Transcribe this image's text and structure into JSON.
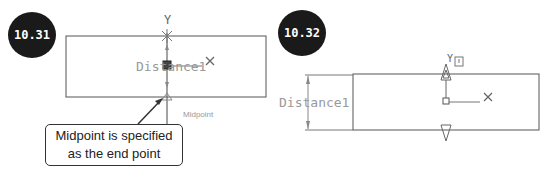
{
  "figures": [
    {
      "id": "left",
      "badge": "10.31",
      "axis_y": "Y",
      "axis_x": "X",
      "dimension_label": "Distance1",
      "snap_tooltip": "Midpoint",
      "callout_line1": "Midpoint is specified",
      "callout_line2": "as the end point"
    },
    {
      "id": "right",
      "badge": "10.32",
      "axis_y": "Y",
      "axis_x": "X",
      "dimension_label": "Distance1"
    }
  ],
  "colors": {
    "badge_bg": "#1a1a1a",
    "line": "#555555",
    "label": "#888888"
  }
}
